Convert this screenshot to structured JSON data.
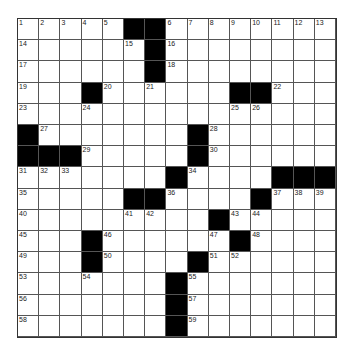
{
  "puzzle": {
    "rows": 15,
    "cols": 15,
    "black": [
      [
        0,
        5
      ],
      [
        0,
        6
      ],
      [
        1,
        6
      ],
      [
        2,
        6
      ],
      [
        3,
        3
      ],
      [
        3,
        10
      ],
      [
        3,
        11
      ],
      [
        5,
        0
      ],
      [
        5,
        8
      ],
      [
        6,
        0
      ],
      [
        6,
        1
      ],
      [
        6,
        2
      ],
      [
        6,
        8
      ],
      [
        7,
        7
      ],
      [
        7,
        12
      ],
      [
        7,
        13
      ],
      [
        7,
        14
      ],
      [
        8,
        5
      ],
      [
        8,
        6
      ],
      [
        8,
        11
      ],
      [
        9,
        9
      ],
      [
        10,
        3
      ],
      [
        10,
        10
      ],
      [
        11,
        3
      ],
      [
        11,
        8
      ],
      [
        12,
        7
      ],
      [
        13,
        7
      ],
      [
        14,
        7
      ]
    ],
    "numbers": [
      [
        0,
        0,
        "1"
      ],
      [
        0,
        1,
        "2"
      ],
      [
        0,
        2,
        "3"
      ],
      [
        0,
        3,
        "4"
      ],
      [
        0,
        4,
        "5"
      ],
      [
        0,
        7,
        "6"
      ],
      [
        0,
        8,
        "7"
      ],
      [
        0,
        9,
        "8"
      ],
      [
        0,
        10,
        "9"
      ],
      [
        0,
        11,
        "10"
      ],
      [
        0,
        12,
        "11"
      ],
      [
        0,
        13,
        "12"
      ],
      [
        0,
        14,
        "13"
      ],
      [
        1,
        0,
        "14"
      ],
      [
        1,
        5,
        "15"
      ],
      [
        1,
        7,
        "16"
      ],
      [
        2,
        0,
        "17"
      ],
      [
        2,
        7,
        "18"
      ],
      [
        3,
        0,
        "19"
      ],
      [
        3,
        4,
        "20"
      ],
      [
        3,
        6,
        "21"
      ],
      [
        3,
        12,
        "22"
      ],
      [
        4,
        0,
        "23"
      ],
      [
        4,
        3,
        "24"
      ],
      [
        4,
        10,
        "25"
      ],
      [
        4,
        11,
        "26"
      ],
      [
        5,
        1,
        "27"
      ],
      [
        5,
        9,
        "28"
      ],
      [
        6,
        3,
        "29"
      ],
      [
        6,
        9,
        "30"
      ],
      [
        7,
        0,
        "31"
      ],
      [
        7,
        1,
        "32"
      ],
      [
        7,
        2,
        "33"
      ],
      [
        7,
        8,
        "34"
      ],
      [
        8,
        0,
        "35"
      ],
      [
        8,
        7,
        "36"
      ],
      [
        8,
        12,
        "37"
      ],
      [
        8,
        13,
        "38"
      ],
      [
        8,
        14,
        "39"
      ],
      [
        9,
        0,
        "40"
      ],
      [
        9,
        5,
        "41"
      ],
      [
        9,
        6,
        "42"
      ],
      [
        9,
        10,
        "43"
      ],
      [
        9,
        11,
        "44"
      ],
      [
        10,
        0,
        "45"
      ],
      [
        10,
        4,
        "46"
      ],
      [
        10,
        9,
        "47"
      ],
      [
        10,
        11,
        "48"
      ],
      [
        11,
        0,
        "49"
      ],
      [
        11,
        4,
        "50"
      ],
      [
        11,
        9,
        "51"
      ],
      [
        11,
        10,
        "52"
      ],
      [
        12,
        0,
        "53"
      ],
      [
        12,
        3,
        "54"
      ],
      [
        12,
        8,
        "55"
      ],
      [
        13,
        0,
        "56"
      ],
      [
        13,
        8,
        "57"
      ],
      [
        14,
        0,
        "58"
      ],
      [
        14,
        8,
        "59"
      ]
    ]
  }
}
